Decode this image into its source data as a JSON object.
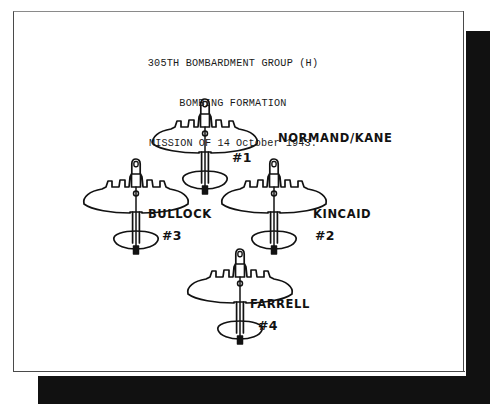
{
  "document": {
    "type": "scanned-document-photo",
    "page_background": "#ffffff",
    "shadow_color": "#111111",
    "ink_color": "#121212"
  },
  "heading": {
    "line1": "305TH BOMBARDMENT GROUP (H)",
    "line2": "BOMBING FORMATION",
    "line3": "MISSION OF 14 October 1943."
  },
  "diagram": {
    "formation_shape": "diamond",
    "aircraft": [
      {
        "id": "aircraft-1",
        "pilot_label": "NORMAND/KANE",
        "position_number": "#1",
        "slot": "lead",
        "cx": 205,
        "cy": 138,
        "scale": 1.0,
        "label_x": 278,
        "label_y": 142,
        "number_x": 232,
        "number_y": 162
      },
      {
        "id": "aircraft-3",
        "pilot_label": "BULLOCK",
        "position_number": "#3",
        "slot": "left-wing",
        "cx": 136,
        "cy": 198,
        "scale": 1.0,
        "label_x": 148,
        "label_y": 218,
        "number_x": 162,
        "number_y": 240
      },
      {
        "id": "aircraft-2",
        "pilot_label": "KINCAID",
        "position_number": "#2",
        "slot": "right-wing",
        "cx": 274,
        "cy": 198,
        "scale": 1.0,
        "label_x": 313,
        "label_y": 218,
        "number_x": 315,
        "number_y": 240
      },
      {
        "id": "aircraft-4",
        "pilot_label": "FARRELL",
        "position_number": "#4",
        "slot": "slot-tail",
        "cx": 240,
        "cy": 288,
        "scale": 1.0,
        "label_x": 250,
        "label_y": 308,
        "number_x": 258,
        "number_y": 330
      }
    ]
  }
}
